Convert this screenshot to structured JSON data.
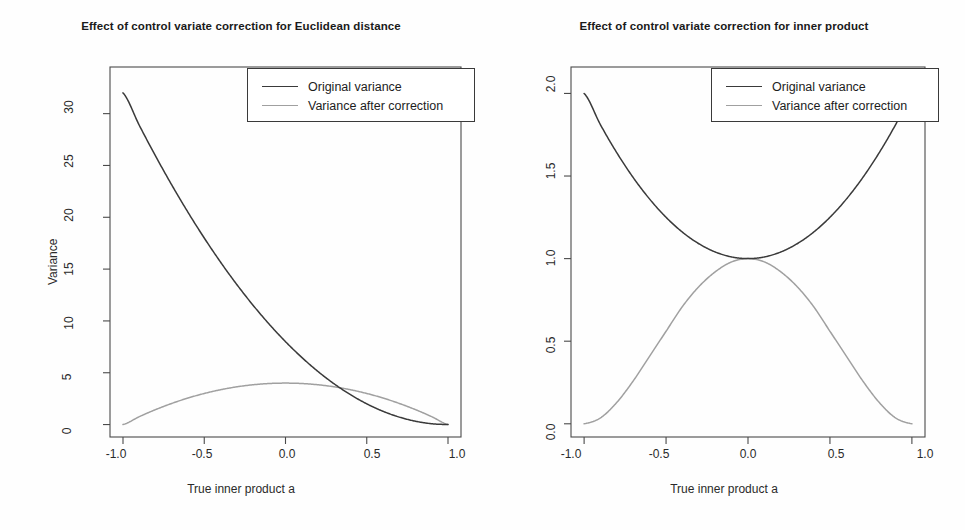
{
  "figure": {
    "background_color": "#fefefe",
    "panel_count": 2
  },
  "colors": {
    "original_variance_line": "#3a3a3a",
    "corrected_variance_line": "#a0a0a0",
    "axis": "#4a4a4a",
    "text": "#1a1a1a"
  },
  "panels": {
    "left": {
      "title": "Effect of control variate correction for Euclidean distance",
      "xlabel": "True inner product a",
      "ylabel": "Variance",
      "xticks": [
        "-1.0",
        "-0.5",
        "0.0",
        "0.5",
        "1.0"
      ],
      "yticks": [
        "0",
        "5",
        "10",
        "15",
        "20",
        "25",
        "30"
      ],
      "legend": {
        "items": [
          {
            "label": "Original variance",
            "color": "#3a3a3a"
          },
          {
            "label": "Variance after correction",
            "color": "#a0a0a0"
          }
        ]
      }
    },
    "right": {
      "title": "Effect of control variate correction for inner product",
      "xlabel": "True inner product a",
      "ylabel": "Variance",
      "xticks": [
        "-1.0",
        "-0.5",
        "0.0",
        "0.5",
        "1.0"
      ],
      "yticks": [
        "0.0",
        "0.5",
        "1.0",
        "1.5",
        "2.0"
      ],
      "legend": {
        "items": [
          {
            "label": "Original variance",
            "color": "#3a3a3a"
          },
          {
            "label": "Variance after correction",
            "color": "#a0a0a0"
          }
        ]
      }
    }
  },
  "chart_data": [
    {
      "type": "line",
      "title": "Effect of control variate correction for Euclidean distance",
      "xlabel": "True inner product a",
      "ylabel": "Variance",
      "xlim": [
        -1.08,
        1.08
      ],
      "ylim": [
        -1.2,
        34.5
      ],
      "xticks": [
        -1.0,
        -0.5,
        0.0,
        0.5,
        1.0
      ],
      "yticks": [
        0,
        5,
        10,
        15,
        20,
        25,
        30
      ],
      "grid": false,
      "legend_position": "top-right",
      "x": [
        -1.0,
        -0.9,
        -0.8,
        -0.7,
        -0.6,
        -0.5,
        -0.4,
        -0.3,
        -0.2,
        -0.1,
        0.0,
        0.1,
        0.2,
        0.3,
        0.4,
        0.5,
        0.6,
        0.7,
        0.8,
        0.9,
        1.0
      ],
      "series": [
        {
          "name": "Original variance",
          "color": "#3a3a3a",
          "values": [
            32.0,
            28.88,
            25.92,
            23.12,
            20.48,
            18.0,
            15.68,
            13.52,
            11.52,
            9.68,
            8.0,
            6.48,
            5.12,
            3.92,
            2.88,
            2.0,
            1.28,
            0.72,
            0.32,
            0.08,
            0.0
          ]
        },
        {
          "name": "Variance after correction",
          "color": "#a0a0a0",
          "values": [
            0.0,
            0.76,
            1.44,
            2.04,
            2.56,
            3.0,
            3.36,
            3.64,
            3.84,
            3.96,
            4.0,
            3.96,
            3.84,
            3.64,
            3.36,
            3.0,
            2.56,
            2.04,
            1.44,
            0.76,
            0.0
          ]
        }
      ]
    },
    {
      "type": "line",
      "title": "Effect of control variate correction for inner product",
      "xlabel": "True inner product a",
      "ylabel": "Variance",
      "xlim": [
        -1.08,
        1.08
      ],
      "ylim": [
        -0.08,
        2.16
      ],
      "xticks": [
        -1.0,
        -0.5,
        0.0,
        0.5,
        1.0
      ],
      "yticks": [
        0.0,
        0.5,
        1.0,
        1.5,
        2.0
      ],
      "grid": false,
      "legend_position": "top-right",
      "x": [
        -1.0,
        -0.9,
        -0.8,
        -0.7,
        -0.6,
        -0.5,
        -0.4,
        -0.3,
        -0.2,
        -0.1,
        0.0,
        0.1,
        0.2,
        0.3,
        0.4,
        0.5,
        0.6,
        0.7,
        0.8,
        0.9,
        1.0
      ],
      "series": [
        {
          "name": "Original variance",
          "color": "#3a3a3a",
          "values": [
            2.0,
            1.81,
            1.64,
            1.49,
            1.36,
            1.25,
            1.16,
            1.09,
            1.04,
            1.01,
            1.0,
            1.01,
            1.04,
            1.09,
            1.16,
            1.25,
            1.36,
            1.49,
            1.64,
            1.81,
            2.0
          ]
        },
        {
          "name": "Variance after correction",
          "color": "#a0a0a0",
          "values": [
            0.0,
            0.036,
            0.13,
            0.26,
            0.41,
            0.56,
            0.71,
            0.83,
            0.92,
            0.98,
            1.0,
            0.98,
            0.92,
            0.83,
            0.71,
            0.56,
            0.41,
            0.26,
            0.13,
            0.036,
            0.0
          ]
        }
      ]
    }
  ]
}
